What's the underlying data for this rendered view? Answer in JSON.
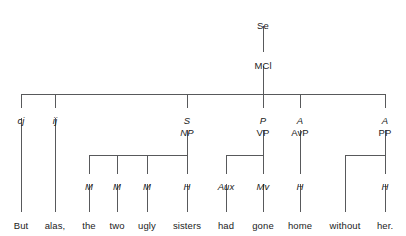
{
  "chart_data": {
    "type": "diagram",
    "diagram_kind": "syntactic-tree",
    "title": "",
    "sentence": "But alas, the two ugly sisters had gone home without her.",
    "line_color": "#58595b",
    "text_color": "#1b1b1b",
    "background": "#ffffff",
    "nodes": [
      {
        "id": "se",
        "label": "Se",
        "style": "form",
        "x": 263,
        "y": 20
      },
      {
        "id": "mcl",
        "label": "MCl",
        "style": "form",
        "x": 263,
        "y": 60
      },
      {
        "id": "cj",
        "label": "cj",
        "style": "fn",
        "x": 21,
        "y": 115
      },
      {
        "id": "ij",
        "label": "ij",
        "style": "fn",
        "x": 55,
        "y": 115
      },
      {
        "id": "s-fn",
        "label": "S",
        "style": "fn",
        "x": 187,
        "y": 115
      },
      {
        "id": "np-form",
        "label": "NP",
        "style": "fn",
        "x": 187,
        "y": 127
      },
      {
        "id": "p-fn",
        "label": "P",
        "style": "fn",
        "x": 263,
        "y": 115
      },
      {
        "id": "vp-form",
        "label": "VP",
        "style": "form",
        "x": 263,
        "y": 127
      },
      {
        "id": "a1-fn",
        "label": "A",
        "style": "fn",
        "x": 300,
        "y": 115
      },
      {
        "id": "avp-form",
        "label": "AvP",
        "style": "form",
        "x": 300,
        "y": 127
      },
      {
        "id": "a2-fn",
        "label": "A",
        "style": "fn",
        "x": 385,
        "y": 115
      },
      {
        "id": "pp-form",
        "label": "PP",
        "style": "form",
        "x": 385,
        "y": 127
      },
      {
        "id": "m1",
        "label": "M",
        "style": "fn",
        "x": 89,
        "y": 181
      },
      {
        "id": "m2",
        "label": "M",
        "style": "fn",
        "x": 117,
        "y": 181
      },
      {
        "id": "m3",
        "label": "M",
        "style": "fn",
        "x": 147,
        "y": 181
      },
      {
        "id": "h-np",
        "label": "H",
        "style": "fn",
        "x": 187,
        "y": 181
      },
      {
        "id": "aux",
        "label": "Aux",
        "style": "fn",
        "x": 226,
        "y": 181
      },
      {
        "id": "mv",
        "label": "Mv",
        "style": "fn",
        "x": 263,
        "y": 181
      },
      {
        "id": "h-avp",
        "label": "H",
        "style": "fn",
        "x": 300,
        "y": 181
      },
      {
        "id": "h-pp",
        "label": "H",
        "style": "fn",
        "x": 385,
        "y": 181
      }
    ],
    "words": [
      {
        "id": "w-but",
        "label": "But",
        "x": 21
      },
      {
        "id": "w-alas",
        "label": "alas,",
        "x": 55
      },
      {
        "id": "w-the",
        "label": "the",
        "x": 89
      },
      {
        "id": "w-two",
        "label": "two",
        "x": 117
      },
      {
        "id": "w-ugly",
        "label": "ugly",
        "x": 147
      },
      {
        "id": "w-sisters",
        "label": "sisters",
        "x": 187
      },
      {
        "id": "w-had",
        "label": "had",
        "x": 226
      },
      {
        "id": "w-gone",
        "label": "gone",
        "x": 263
      },
      {
        "id": "w-home",
        "label": "home",
        "x": 300
      },
      {
        "id": "w-without",
        "label": "without",
        "x": 345
      },
      {
        "id": "w-her",
        "label": "her.",
        "x": 385
      }
    ],
    "words_y": 220,
    "edges": [
      {
        "name": "se-to-mcl",
        "type": "v",
        "x": 263,
        "y1": 26,
        "y2": 52
      },
      {
        "name": "mcl-to-bar",
        "type": "v",
        "x": 263,
        "y1": 66,
        "y2": 94
      },
      {
        "name": "clause-bar",
        "type": "h",
        "y": 94,
        "x1": 21,
        "x2": 385
      },
      {
        "name": "bar-to-cj",
        "type": "v",
        "x": 21,
        "y1": 94,
        "y2": 108
      },
      {
        "name": "bar-to-ij",
        "type": "v",
        "x": 55,
        "y1": 94,
        "y2": 108
      },
      {
        "name": "bar-to-s",
        "type": "v",
        "x": 187,
        "y1": 94,
        "y2": 108
      },
      {
        "name": "bar-to-p",
        "type": "v",
        "x": 263,
        "y1": 94,
        "y2": 108
      },
      {
        "name": "bar-to-a1",
        "type": "v",
        "x": 300,
        "y1": 94,
        "y2": 108
      },
      {
        "name": "bar-to-a2",
        "type": "v",
        "x": 385,
        "y1": 94,
        "y2": 108
      },
      {
        "name": "cj-to-but",
        "type": "v",
        "x": 21,
        "y1": 118,
        "y2": 212
      },
      {
        "name": "ij-to-alas",
        "type": "v",
        "x": 55,
        "y1": 118,
        "y2": 212
      },
      {
        "name": "np-to-bar",
        "type": "v",
        "x": 187,
        "y1": 130,
        "y2": 155
      },
      {
        "name": "np-bar",
        "type": "h",
        "y": 155,
        "x1": 89,
        "x2": 187
      },
      {
        "name": "npbar-to-m1",
        "type": "v",
        "x": 89,
        "y1": 155,
        "y2": 174
      },
      {
        "name": "npbar-to-m2",
        "type": "v",
        "x": 117,
        "y1": 155,
        "y2": 174
      },
      {
        "name": "npbar-to-m3",
        "type": "v",
        "x": 147,
        "y1": 155,
        "y2": 174
      },
      {
        "name": "npbar-to-h",
        "type": "v",
        "x": 187,
        "y1": 155,
        "y2": 174
      },
      {
        "name": "m1-to-the",
        "type": "v",
        "x": 89,
        "y1": 184,
        "y2": 212
      },
      {
        "name": "m2-to-two",
        "type": "v",
        "x": 117,
        "y1": 184,
        "y2": 212
      },
      {
        "name": "m3-to-ugly",
        "type": "v",
        "x": 147,
        "y1": 184,
        "y2": 212
      },
      {
        "name": "h-to-sisters",
        "type": "v",
        "x": 187,
        "y1": 184,
        "y2": 212
      },
      {
        "name": "vp-to-bar",
        "type": "v",
        "x": 263,
        "y1": 130,
        "y2": 155
      },
      {
        "name": "vp-bar",
        "type": "h",
        "y": 155,
        "x1": 226,
        "x2": 263
      },
      {
        "name": "vpbar-to-aux",
        "type": "v",
        "x": 226,
        "y1": 155,
        "y2": 174
      },
      {
        "name": "vpbar-to-mv",
        "type": "v",
        "x": 263,
        "y1": 155,
        "y2": 174
      },
      {
        "name": "aux-to-had",
        "type": "v",
        "x": 226,
        "y1": 184,
        "y2": 212
      },
      {
        "name": "mv-to-gone",
        "type": "v",
        "x": 263,
        "y1": 184,
        "y2": 212
      },
      {
        "name": "avp-to-h",
        "type": "v",
        "x": 300,
        "y1": 130,
        "y2": 174
      },
      {
        "name": "h-to-home",
        "type": "v",
        "x": 300,
        "y1": 184,
        "y2": 212
      },
      {
        "name": "pp-to-bar",
        "type": "v",
        "x": 385,
        "y1": 130,
        "y2": 155
      },
      {
        "name": "pp-bar",
        "type": "h",
        "y": 155,
        "x1": 345,
        "x2": 385
      },
      {
        "name": "ppbar-to-without",
        "type": "v",
        "x": 345,
        "y1": 155,
        "y2": 212
      },
      {
        "name": "ppbar-to-h",
        "type": "v",
        "x": 385,
        "y1": 155,
        "y2": 174
      },
      {
        "name": "h-to-her",
        "type": "v",
        "x": 385,
        "y1": 184,
        "y2": 212
      }
    ]
  }
}
